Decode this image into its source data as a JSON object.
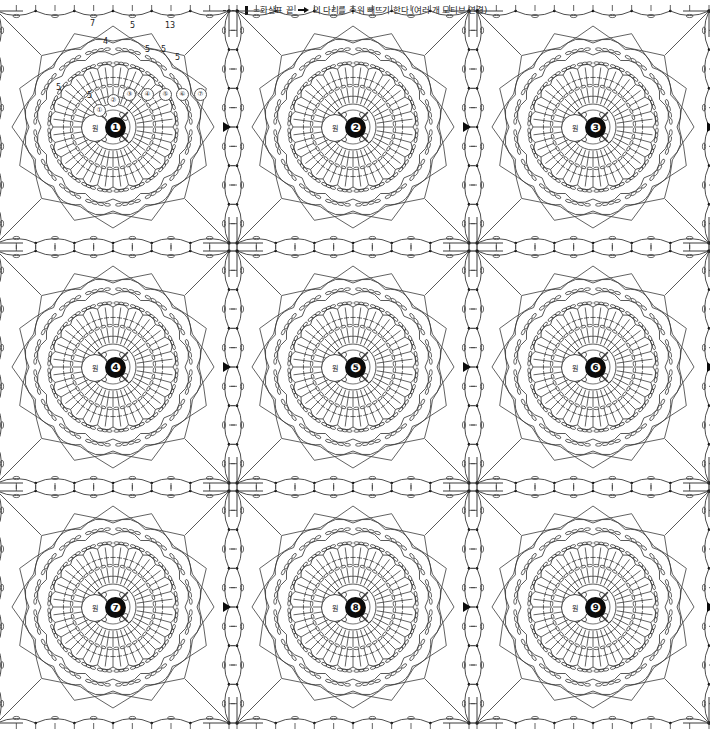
{
  "legend": {
    "dash_icon": "dashed-line-icon",
    "bar_icon": "slip-stitch-bar-icon",
    "arrow_icon": "arrow-right-icon",
    "text_before": "=화살표 끝",
    "text_after": "의 다리를 주워 빼뜨기 한다 (여러 개 모티브 연결)"
  },
  "chart": {
    "type": "crochet-motif-diagram",
    "grid_rows": 3,
    "grid_cols": 3,
    "motif_count": 9,
    "motif_size_px": 240,
    "center_ring_label": "원",
    "rounds_per_motif": 7,
    "line_color": "#3a3a3a",
    "accent_color": "#0b0b0b"
  },
  "motifs": [
    {
      "number": "❶",
      "row": 0,
      "col": 0,
      "ring": "원"
    },
    {
      "number": "❷",
      "row": 0,
      "col": 1,
      "ring": "원"
    },
    {
      "number": "❸",
      "row": 0,
      "col": 2,
      "ring": "원"
    },
    {
      "number": "❹",
      "row": 1,
      "col": 0,
      "ring": "원"
    },
    {
      "number": "❺",
      "row": 1,
      "col": 1,
      "ring": "원"
    },
    {
      "number": "❻",
      "row": 1,
      "col": 2,
      "ring": "원"
    },
    {
      "number": "❼",
      "row": 2,
      "col": 0,
      "ring": "원"
    },
    {
      "number": "❽",
      "row": 2,
      "col": 1,
      "ring": "원"
    },
    {
      "number": "❾",
      "row": 2,
      "col": 2,
      "ring": "원"
    }
  ],
  "round_marks": [
    {
      "label": "①",
      "x": 98,
      "y": 92
    },
    {
      "label": "②",
      "x": 112,
      "y": 82
    },
    {
      "label": "③",
      "x": 128,
      "y": 76
    },
    {
      "label": "④",
      "x": 146,
      "y": 76
    },
    {
      "label": "⑤",
      "x": 164,
      "y": 76
    },
    {
      "label": "⑥",
      "x": 181,
      "y": 76
    },
    {
      "label": "⑦",
      "x": 199,
      "y": 76
    }
  ],
  "count_labels": [
    {
      "value": "7",
      "x": 95,
      "y": 8
    },
    {
      "value": "5",
      "x": 135,
      "y": 10
    },
    {
      "value": "13",
      "x": 170,
      "y": 10
    },
    {
      "value": "4",
      "x": 108,
      "y": 26
    },
    {
      "value": "5",
      "x": 150,
      "y": 34
    },
    {
      "value": "5",
      "x": 166,
      "y": 34
    },
    {
      "value": "5",
      "x": 180,
      "y": 42
    },
    {
      "value": "5",
      "x": 61,
      "y": 72
    },
    {
      "value": "5",
      "x": 92,
      "y": 80
    }
  ]
}
